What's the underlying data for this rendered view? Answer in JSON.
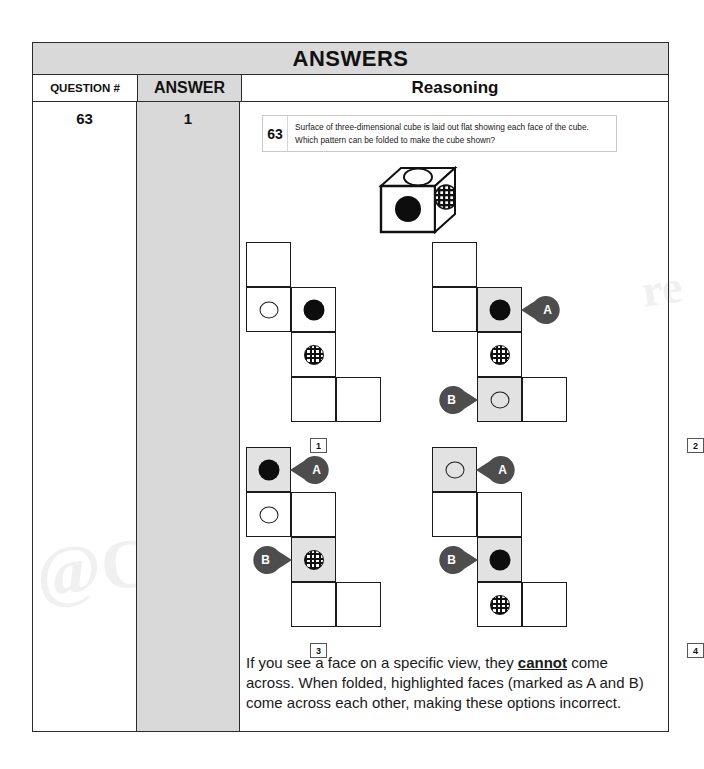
{
  "sheet": {
    "banner_title": "ANSWERS",
    "columns": {
      "question_header": "QUESTION #",
      "answer_header": "ANSWER",
      "reasoning_header": "Reasoning"
    },
    "row": {
      "question_number": "63",
      "answer_value": "1"
    }
  },
  "prompt": {
    "number": "63",
    "text": "Surface of three-dimensional cube is laid out flat showing each face of the cube. Which pattern can be folded to make the cube shown?"
  },
  "cube": {
    "top_face_mark": "open-circle",
    "front_face_mark": "filled-circle",
    "right_face_mark": "hatched-circle"
  },
  "options": [
    {
      "label": "1",
      "cells": [
        {
          "row": 0,
          "col": 0,
          "mark": "none",
          "highlighted": false
        },
        {
          "row": 1,
          "col": 0,
          "mark": "open-circle",
          "highlighted": false
        },
        {
          "row": 1,
          "col": 1,
          "mark": "filled-circle",
          "highlighted": false
        },
        {
          "row": 2,
          "col": 1,
          "mark": "hatched-circle",
          "highlighted": false
        },
        {
          "row": 3,
          "col": 1,
          "mark": "none",
          "highlighted": false
        },
        {
          "row": 3,
          "col": 2,
          "mark": "none",
          "highlighted": false
        }
      ],
      "callouts": []
    },
    {
      "label": "2",
      "cells": [
        {
          "row": 0,
          "col": 0,
          "mark": "none",
          "highlighted": false
        },
        {
          "row": 1,
          "col": 0,
          "mark": "none",
          "highlighted": false
        },
        {
          "row": 1,
          "col": 1,
          "mark": "filled-circle",
          "highlighted": true
        },
        {
          "row": 2,
          "col": 1,
          "mark": "hatched-circle",
          "highlighted": false
        },
        {
          "row": 3,
          "col": 1,
          "mark": "open-circle",
          "highlighted": true
        },
        {
          "row": 3,
          "col": 2,
          "mark": "none",
          "highlighted": false
        }
      ],
      "callouts": [
        {
          "letter": "A",
          "side": "right",
          "row": 1,
          "col": 1
        },
        {
          "letter": "B",
          "side": "left",
          "row": 3,
          "col": 1
        }
      ]
    },
    {
      "label": "3",
      "cells": [
        {
          "row": 0,
          "col": 0,
          "mark": "filled-circle",
          "highlighted": true
        },
        {
          "row": 1,
          "col": 0,
          "mark": "open-circle",
          "highlighted": false
        },
        {
          "row": 1,
          "col": 1,
          "mark": "none",
          "highlighted": false
        },
        {
          "row": 2,
          "col": 1,
          "mark": "hatched-circle",
          "highlighted": true
        },
        {
          "row": 3,
          "col": 1,
          "mark": "none",
          "highlighted": false
        },
        {
          "row": 3,
          "col": 2,
          "mark": "none",
          "highlighted": false
        }
      ],
      "callouts": [
        {
          "letter": "A",
          "side": "right",
          "row": 0,
          "col": 0
        },
        {
          "letter": "B",
          "side": "left",
          "row": 2,
          "col": 1
        }
      ]
    },
    {
      "label": "4",
      "cells": [
        {
          "row": 0,
          "col": 0,
          "mark": "open-circle",
          "highlighted": true
        },
        {
          "row": 1,
          "col": 0,
          "mark": "none",
          "highlighted": false
        },
        {
          "row": 1,
          "col": 1,
          "mark": "none",
          "highlighted": false
        },
        {
          "row": 2,
          "col": 1,
          "mark": "filled-circle",
          "highlighted": true
        },
        {
          "row": 3,
          "col": 1,
          "mark": "hatched-circle",
          "highlighted": false
        },
        {
          "row": 3,
          "col": 2,
          "mark": "none",
          "highlighted": false
        }
      ],
      "callouts": [
        {
          "letter": "A",
          "side": "right",
          "row": 0,
          "col": 0
        },
        {
          "letter": "B",
          "side": "left",
          "row": 2,
          "col": 1
        }
      ]
    }
  ],
  "explanation": {
    "part1": "If you see a face on a specific view, they ",
    "emphasis": "cannot",
    "part2": " come across. When folded, highlighted faces (marked as A and B) come across each other, making these options incorrect."
  },
  "watermarks": {
    "left": "@C",
    "right": "re"
  },
  "colors": {
    "banner_bg": "#d9d9d9",
    "answer_col_bg": "#d9d9d9",
    "highlight_cell": "#e2e2e2",
    "callout_fill": "#4d4d4d",
    "border": "#2b2b2b"
  }
}
